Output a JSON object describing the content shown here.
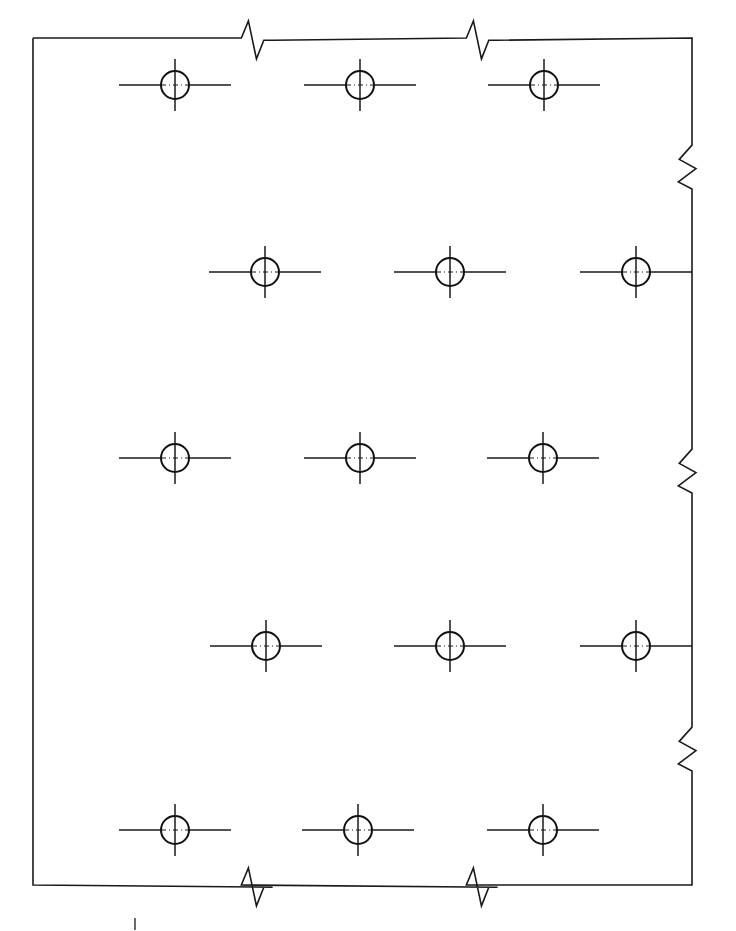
{
  "drawing": {
    "title": "Perforated Plate Hole Pattern Detail",
    "description": "Partial orthographic view of a flat plate with a staggered grid of drilled holes; all four visible edges terminated with conventional break symbols.",
    "canvas": {
      "width": 736,
      "height": 931,
      "background": "#ffffff"
    },
    "line_colors": {
      "outline": "#1a1a1a",
      "hole": "#111111",
      "center_mark": "#1a1a1a",
      "center_dashdot": "#1a1a1a",
      "stray_tick": "#2b2b2b"
    },
    "line_weights": {
      "outline": 1.6,
      "hole": 2.0,
      "center_mark": 1.5,
      "center_dashdot": 1.2
    }
  },
  "plate": {
    "name": "plate-outline",
    "left": 33,
    "top": 38,
    "right": 692,
    "bottom": 885,
    "width": 659,
    "height": 847
  },
  "break_symbols": {
    "style": "zigzag-short-break",
    "amplitude": 22,
    "top": [
      {
        "name": "break-top-1",
        "position": 255
      },
      {
        "name": "break-top-2",
        "position": 480
      }
    ],
    "right": [
      {
        "name": "break-right-1",
        "position": 166
      },
      {
        "name": "break-right-2",
        "position": 470
      },
      {
        "name": "break-right-3",
        "position": 748
      }
    ],
    "bottom": [
      {
        "name": "break-bottom-1",
        "position": 255
      },
      {
        "name": "break-bottom-2",
        "position": 480
      }
    ]
  },
  "hole_pattern": {
    "type": "staggered-grid",
    "hole_count": 15,
    "row_count": 5,
    "holes_per_row": 3,
    "hole_diameter_px": 28,
    "hole_radius_px": 14,
    "center_mark_arm_solid_px": 26,
    "center_mark_arm_long_px": 56,
    "row_pitch_px": 186,
    "column_pitch_px": 185,
    "stagger_offset_px": 91,
    "rows": [
      {
        "name": "hole-row-1",
        "y": 85,
        "holes": [
          {
            "name": "hole-r1-c1",
            "cx": 175,
            "cy": 85
          },
          {
            "name": "hole-r1-c2",
            "cx": 360,
            "cy": 85
          },
          {
            "name": "hole-r1-c3",
            "cx": 544,
            "cy": 85
          }
        ]
      },
      {
        "name": "hole-row-2",
        "y": 272,
        "holes": [
          {
            "name": "hole-r2-c1",
            "cx": 265,
            "cy": 272
          },
          {
            "name": "hole-r2-c2",
            "cx": 450,
            "cy": 272
          },
          {
            "name": "hole-r2-c3",
            "cx": 636,
            "cy": 272
          }
        ]
      },
      {
        "name": "hole-row-3",
        "y": 458,
        "holes": [
          {
            "name": "hole-r3-c1",
            "cx": 175,
            "cy": 458
          },
          {
            "name": "hole-r3-c2",
            "cx": 360,
            "cy": 458
          },
          {
            "name": "hole-r3-c3",
            "cx": 543,
            "cy": 458
          }
        ]
      },
      {
        "name": "hole-row-4",
        "y": 646,
        "holes": [
          {
            "name": "hole-r4-c1",
            "cx": 266,
            "cy": 646
          },
          {
            "name": "hole-r4-c2",
            "cx": 450,
            "cy": 646
          },
          {
            "name": "hole-r4-c3",
            "cx": 636,
            "cy": 646
          }
        ]
      },
      {
        "name": "hole-row-5",
        "y": 830,
        "holes": [
          {
            "name": "hole-r5-c1",
            "cx": 175,
            "cy": 830
          },
          {
            "name": "hole-r5-c2",
            "cx": 358,
            "cy": 830
          },
          {
            "name": "hole-r5-c3",
            "cx": 543,
            "cy": 830
          }
        ]
      }
    ]
  },
  "annotations": {
    "stray_tick": {
      "name": "stray-tick-mark",
      "x": 135,
      "y": 918,
      "length": 12
    }
  }
}
